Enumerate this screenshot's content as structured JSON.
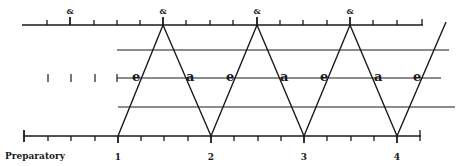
{
  "diagram": {
    "type": "conducting-beat-pattern",
    "top_ruler": {
      "subdivision_label": "&",
      "and_positions": [
        70,
        163,
        257,
        350
      ],
      "ticks": [
        47,
        70,
        94,
        117,
        140,
        163,
        186,
        210,
        233,
        257,
        280,
        303,
        327,
        350,
        373,
        397,
        420
      ]
    },
    "bottom_ruler": {
      "ticks": [
        24,
        48,
        71,
        95,
        118,
        141,
        164,
        188,
        211,
        234,
        258,
        281,
        304,
        327,
        351,
        374,
        397,
        420
      ],
      "labels": {
        "preparatory": "Preparatory",
        "beat1": "1",
        "beat2": "2",
        "beat3": "3",
        "beat4": "4"
      }
    },
    "middle_labels": {
      "e1": "e",
      "a1": "a",
      "e2": "e",
      "a2": "a",
      "e3": "e",
      "a3": "a",
      "e4": "e"
    },
    "amp_labels": {
      "amp1": "&",
      "amp2": "&",
      "amp3": "&",
      "amp4": "&"
    },
    "zigzag_points": "118,136 163,25 211,136 257,25 304,136 350,25 397,136 446,22",
    "line_color": "#1a1a1a"
  }
}
